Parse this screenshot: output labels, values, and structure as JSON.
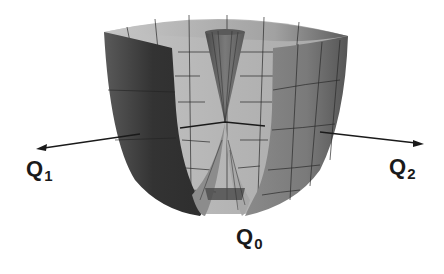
{
  "figure": {
    "labels": {
      "q1": {
        "main": "Q",
        "sub": "1"
      },
      "q2": {
        "main": "Q",
        "sub": "2"
      },
      "q0": {
        "main": "Q",
        "sub": "0"
      }
    },
    "colors": {
      "outer_dark": "#3a3a3a",
      "outer_mid": "#6e6e6e",
      "inner_light": "#b8b8b8",
      "inner_mid": "#9a9a9a",
      "grid": "#2a2a2a",
      "axis": "#1a1a1a"
    }
  }
}
